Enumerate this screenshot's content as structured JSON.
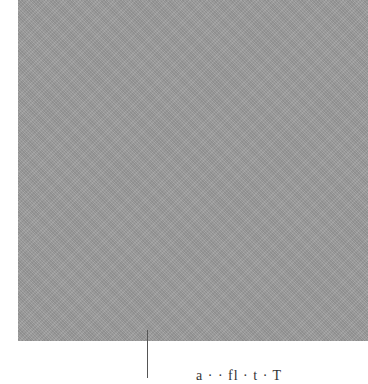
{
  "figure": {
    "swatch_color": "#9c9c9c",
    "caption_partial": "a · · fl · t · T"
  }
}
